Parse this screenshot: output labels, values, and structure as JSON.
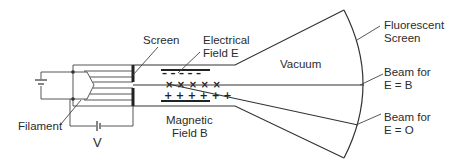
{
  "diagram": {
    "type": "cathode-ray-tube-schematic",
    "labels": {
      "screen": "Screen",
      "electrical_field_line1": "Electrical",
      "electrical_field_line2": "Field E",
      "vacuum": "Vacuum",
      "fluorescent_line1": "Fluorescent",
      "fluorescent_line2": "Screen",
      "beam_eb_line1": "Beam for",
      "beam_eb_line2": "E = B",
      "beam_e0_line1": "Beam for",
      "beam_e0_line2": "E = O",
      "magnetic_line1": "Magnetic",
      "magnetic_line2": "Field B",
      "filament": "Filament",
      "voltage": "V"
    },
    "plate_symbols": {
      "negative": "– – – – –",
      "magnetic_cross": "× × × × ×",
      "positive": "+ + + + + +"
    },
    "colors": {
      "line": "#333333",
      "text": "#2b2b2b",
      "background": "#ffffff"
    }
  }
}
